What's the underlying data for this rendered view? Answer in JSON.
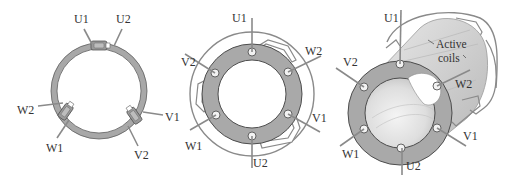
{
  "colors": {
    "ring_fill": "#a9a9a9",
    "ring_stroke": "#555555",
    "wire": "#8a8a8a",
    "cylinder": "#cfcfcf",
    "label": "#333333"
  },
  "panels": [
    {
      "id": "single-ring-coils",
      "labels": {
        "u1": "U1",
        "u2": "U2",
        "v1": "V1",
        "v2": "V2",
        "w1": "W1",
        "w2": "W2"
      }
    },
    {
      "id": "ring-with-terminals",
      "labels": {
        "u1": "U1",
        "u2": "U2",
        "v1": "V1",
        "v2": "V2",
        "w1": "W1",
        "w2": "W2"
      }
    },
    {
      "id": "3d-stator-with-active-coils",
      "labels": {
        "u1": "U1",
        "u2": "U2",
        "v1": "V1",
        "v2": "V2",
        "w1": "W1",
        "w2": "W2"
      },
      "annotation": {
        "line1": "Active",
        "line2": "coils"
      }
    }
  ]
}
